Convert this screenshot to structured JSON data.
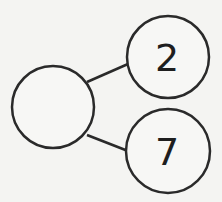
{
  "diagram": {
    "type": "number-bond",
    "whole": {
      "label": ""
    },
    "parts": [
      {
        "label": "2"
      },
      {
        "label": "7"
      }
    ],
    "stroke_color": "#2a2a2a",
    "background": "#f4f4f2"
  }
}
